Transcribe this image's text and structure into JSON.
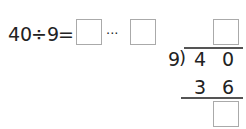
{
  "equation": {
    "dividend": "40",
    "op": "÷",
    "divisor": "9",
    "eq": "=",
    "ellipsis": "···"
  },
  "long_division": {
    "divisor": "9",
    "bracket": ")",
    "dividend_digits": [
      "4",
      "0"
    ],
    "product_digits": [
      "3",
      "6"
    ]
  }
}
